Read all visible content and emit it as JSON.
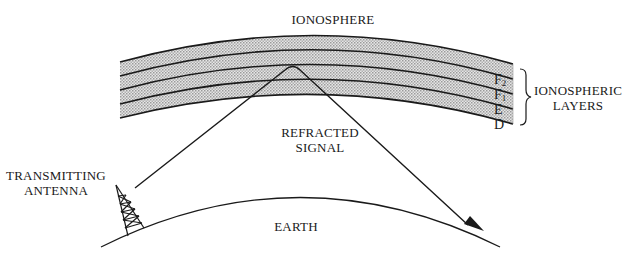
{
  "diagram": {
    "title_label": "IONOSPHERE",
    "signal_label_line1": "REFRACTED",
    "signal_label_line2": "SIGNAL",
    "antenna_label_line1": "TRANSMITTING",
    "antenna_label_line2": "ANTENNA",
    "earth_label": "EARTH",
    "layers_group_line1": "IONOSPHERIC",
    "layers_group_line2": "LAYERS",
    "layers": [
      {
        "name": "F",
        "sub": "2"
      },
      {
        "name": "F",
        "sub": "1"
      },
      {
        "name": "E",
        "sub": ""
      },
      {
        "name": "D",
        "sub": ""
      }
    ],
    "colors": {
      "ink": "#1a1a1a",
      "band_fill": "#c8c8c8"
    }
  }
}
